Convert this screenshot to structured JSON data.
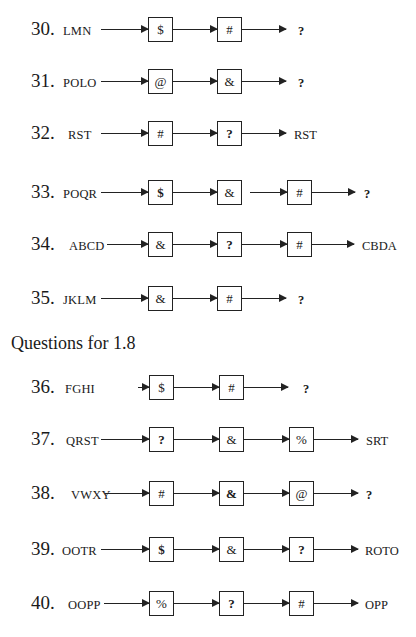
{
  "section_heading": "Questions for 1.8",
  "questions": [
    {
      "number": "30.",
      "input": "LMN",
      "ops": [
        "$",
        "#"
      ],
      "output": "?"
    },
    {
      "number": "31.",
      "input": "POLO",
      "ops": [
        "@",
        "&"
      ],
      "output": "?"
    },
    {
      "number": "32.",
      "input": "RST",
      "ops": [
        "#",
        "?"
      ],
      "output": "RST"
    },
    {
      "number": "33.",
      "input": "POQR",
      "ops": [
        "$",
        "&",
        "#"
      ],
      "output": "?"
    },
    {
      "number": "34.",
      "input": "ABCD",
      "ops": [
        "&",
        "?",
        "#"
      ],
      "output": "CBDA"
    },
    {
      "number": "35.",
      "input": "JKLM",
      "ops": [
        "&",
        "#"
      ],
      "output": "?"
    },
    {
      "number": "36.",
      "input": "FGHI",
      "ops": [
        "$",
        "#"
      ],
      "output": "?"
    },
    {
      "number": "37.",
      "input": "QRST",
      "ops": [
        "?",
        "&",
        "%"
      ],
      "output": "SRT"
    },
    {
      "number": "38.",
      "input": "VWXY",
      "ops": [
        "#",
        "&",
        "@"
      ],
      "output": "?"
    },
    {
      "number": "39.",
      "input": "OOTR",
      "ops": [
        "$",
        "&",
        "?"
      ],
      "output": "ROTO"
    },
    {
      "number": "40.",
      "input": "OOPP",
      "ops": [
        "%",
        "?",
        "#"
      ],
      "output": "OPP"
    }
  ]
}
